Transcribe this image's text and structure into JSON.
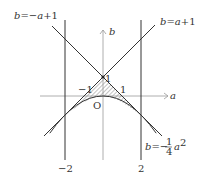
{
  "diagram": {
    "axes": {
      "x_label": "a",
      "y_label": "b",
      "origin_label": "O"
    },
    "curves": [
      {
        "id": "line-neg",
        "label_prefix": "b=",
        "label_expr": "−a+1",
        "equation": "b=-a+1"
      },
      {
        "id": "line-pos",
        "label_prefix": "b=",
        "label_expr": "a+1",
        "equation": "b=a+1"
      },
      {
        "id": "parabola",
        "label_prefix": "b=−",
        "label_frac_num": "1",
        "label_frac_den": "4",
        "label_var": "a",
        "label_exp": "2",
        "equation": "b=-1/4 a^2"
      },
      {
        "id": "vline-left",
        "equation": "a=-2"
      },
      {
        "id": "vline-right",
        "equation": "a=2"
      }
    ],
    "tick_labels": {
      "b_one": "1",
      "a_neg_one": "−1",
      "a_one": "1",
      "a_neg_two": "−2",
      "a_two": "2"
    },
    "shaded_region": "region between b=-a+1, b=a+1 (below) and b=-1/4 a^2 (above), hatched"
  },
  "colors": {
    "line": "#333333",
    "axis": "#999999",
    "hatch": "#666666",
    "background": "#ffffff"
  }
}
